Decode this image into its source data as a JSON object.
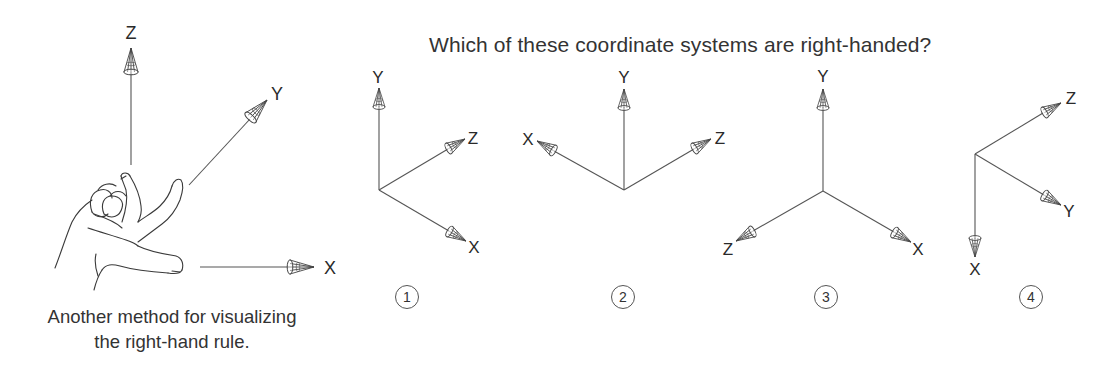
{
  "title": "Which of these coordinate systems are right-handed?",
  "caption": {
    "line1": "Another method for visualizing",
    "line2": "the right-hand rule."
  },
  "hand_figure": {
    "axes": [
      {
        "label": "Z",
        "direction": "up"
      },
      {
        "label": "Y",
        "direction": "up-right"
      },
      {
        "label": "X",
        "direction": "right"
      }
    ]
  },
  "systems": [
    {
      "number": "1",
      "axes": [
        {
          "label": "Y",
          "direction": "up"
        },
        {
          "label": "Z",
          "direction": "up-right"
        },
        {
          "label": "X",
          "direction": "down-right"
        }
      ]
    },
    {
      "number": "2",
      "axes": [
        {
          "label": "Y",
          "direction": "up"
        },
        {
          "label": "X",
          "direction": "up-left"
        },
        {
          "label": "Z",
          "direction": "up-right"
        }
      ]
    },
    {
      "number": "3",
      "axes": [
        {
          "label": "Y",
          "direction": "up"
        },
        {
          "label": "Z",
          "direction": "down-left"
        },
        {
          "label": "X",
          "direction": "down-right"
        }
      ]
    },
    {
      "number": "4",
      "axes": [
        {
          "label": "Z",
          "direction": "up-right"
        },
        {
          "label": "Y",
          "direction": "down-right"
        },
        {
          "label": "X",
          "direction": "down"
        }
      ]
    }
  ],
  "colors": {
    "line": "#555555",
    "text": "#333333",
    "background": "#ffffff"
  }
}
